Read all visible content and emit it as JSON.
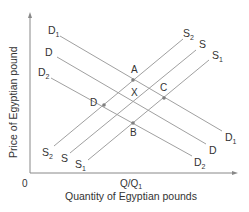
{
  "diagram": {
    "y_axis_label": "Price of Egyptian pound",
    "x_axis_label": "Quantity of Egyptian pounds",
    "origin_label": "0",
    "x_tick_label": "Q/Q",
    "x_tick_sub": "1",
    "colors": {
      "axis": "#888888",
      "line": "#a0a0a0",
      "point": "#808080",
      "text": "#333333"
    },
    "demand_curves": [
      {
        "name": "D1",
        "label": "D",
        "sub": "1",
        "x1": 60,
        "y1": 36,
        "x2": 222,
        "y2": 131
      },
      {
        "name": "D",
        "label": "D",
        "sub": "",
        "x1": 57,
        "y1": 57,
        "x2": 206,
        "y2": 144
      },
      {
        "name": "D2",
        "label": "D",
        "sub": "2",
        "x1": 51,
        "y1": 78,
        "x2": 192,
        "y2": 156
      }
    ],
    "supply_curves": [
      {
        "name": "S2",
        "label": "S",
        "sub": "2",
        "x1": 54,
        "y1": 146,
        "x2": 183,
        "y2": 39
      },
      {
        "name": "S",
        "label": "S",
        "sub": "",
        "x1": 70,
        "y1": 153,
        "x2": 196,
        "y2": 50
      },
      {
        "name": "S1",
        "label": "S",
        "sub": "1",
        "x1": 88,
        "y1": 160,
        "x2": 209,
        "y2": 60
      }
    ],
    "points": [
      {
        "name": "A",
        "label": "A",
        "x": 133,
        "y": 80,
        "lx": 131,
        "ly": 73
      },
      {
        "name": "X",
        "label": "X",
        "x": 133,
        "y": 102,
        "lx": 131,
        "ly": 96,
        "marker": false
      },
      {
        "name": "C",
        "label": "C",
        "x": 164,
        "y": 98,
        "lx": 160,
        "ly": 91
      },
      {
        "name": "D",
        "label": "D",
        "x": 104,
        "y": 105,
        "lx": 90,
        "ly": 106
      },
      {
        "name": "B",
        "label": "B",
        "x": 133,
        "y": 123,
        "lx": 130,
        "ly": 136
      }
    ],
    "curve_labels": [
      {
        "for": "D1",
        "main": "D",
        "sub": "1",
        "x": 48,
        "y": 34
      },
      {
        "for": "D",
        "main": "D",
        "sub": "",
        "x": 45,
        "y": 56
      },
      {
        "for": "D2",
        "main": "D",
        "sub": "2",
        "x": 38,
        "y": 76
      },
      {
        "for": "D1-end",
        "main": "D",
        "sub": "1",
        "x": 225,
        "y": 141
      },
      {
        "for": "D-end",
        "main": "D",
        "sub": "",
        "x": 209,
        "y": 154
      },
      {
        "for": "D2-end",
        "main": "D",
        "sub": "2",
        "x": 194,
        "y": 166
      },
      {
        "for": "S2",
        "main": "S",
        "sub": "2",
        "x": 42,
        "y": 156
      },
      {
        "for": "S",
        "main": "S",
        "sub": "",
        "x": 61,
        "y": 162
      },
      {
        "for": "S1",
        "main": "S",
        "sub": "1",
        "x": 75,
        "y": 168
      },
      {
        "for": "S2-end",
        "main": "S",
        "sub": "2",
        "x": 183,
        "y": 37
      },
      {
        "for": "S-end",
        "main": "S",
        "sub": "",
        "x": 199,
        "y": 48
      },
      {
        "for": "S1-end",
        "main": "S",
        "sub": "1",
        "x": 212,
        "y": 59
      }
    ]
  }
}
